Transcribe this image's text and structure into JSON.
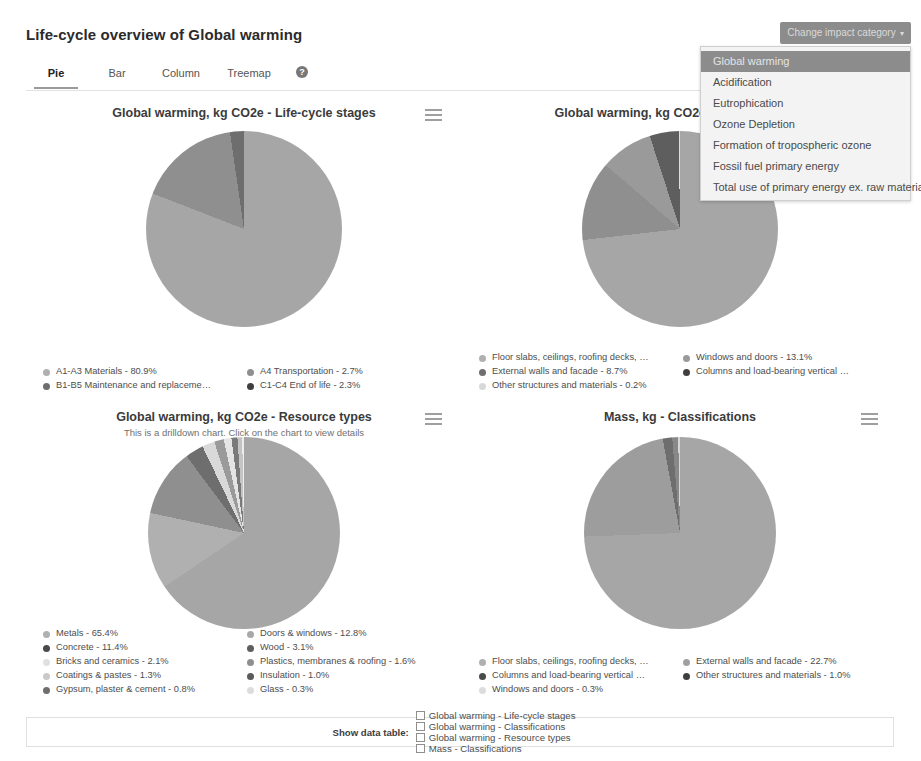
{
  "header": {
    "title": "Life-cycle overview of Global warming",
    "impact_button": "Change impact category",
    "impact_caret": "▾"
  },
  "impact_menu": {
    "items": [
      {
        "label": "Global warming",
        "selected": true
      },
      {
        "label": "Acidification",
        "selected": false
      },
      {
        "label": "Eutrophication",
        "selected": false
      },
      {
        "label": "Ozone Depletion",
        "selected": false
      },
      {
        "label": "Formation of tropospheric ozone",
        "selected": false
      },
      {
        "label": "Fossil fuel primary energy",
        "selected": false
      },
      {
        "label": "Total use of primary energy ex. raw materials",
        "selected": false
      }
    ]
  },
  "tabs": {
    "items": [
      {
        "label": "Pie",
        "active": true
      },
      {
        "label": "Bar",
        "active": false
      },
      {
        "label": "Column",
        "active": false
      },
      {
        "label": "Treemap",
        "active": false
      }
    ],
    "help_glyph": "?"
  },
  "colors": {
    "slice_1": "#a6a6a6",
    "slice_2": "#8f8f8f",
    "slice_3": "#b9b9b9",
    "slice_4": "#6e6e6e",
    "slice_5": "#d9d9d9",
    "slice_6": "#979797",
    "slice_7": "#707070",
    "slice_8": "#c9c9c9",
    "slice_9": "#bdbdbd",
    "slice_10": "#e4e4e4",
    "accent": "#8c8c8c",
    "panel_border": "#e0e0e0"
  },
  "chart_data": [
    {
      "type": "pie",
      "title": "Global warming, kg CO2e - Life-cycle stages",
      "subtitle": "",
      "legend_position": "bottom",
      "categories": [
        "A1-A3 Materials",
        "A4 Transportation",
        "B1-B5 Maintenance and replaceme…",
        "C1-C4 End of life"
      ],
      "legend_labels": [
        "A1-A3 Materials - 80.9%",
        "A4 Transportation - 2.7%",
        "B1-B5 Maintenance and replaceme…",
        "C1-C4 End of life - 2.3%"
      ],
      "values": [
        80.9,
        2.7,
        14.1,
        2.3
      ],
      "unit": "%",
      "slice_colors": [
        "#a6a6a6",
        "#8f8f8f",
        "#8f8f8f",
        "#6e6e6e"
      ],
      "legend_dot_colors": [
        "#b0b0b0",
        "#8f8f8f",
        "#6e6e6e",
        "#3f3f3f"
      ]
    },
    {
      "type": "pie",
      "title": "Global warming, kg CO2e - Classifications",
      "subtitle": "",
      "legend_position": "bottom",
      "categories": [
        "Floor slabs, ceilings, roofing decks, …",
        "Windows and doors",
        "External walls and facade",
        "Columns and load-bearing vertical …",
        "Other structures and materials"
      ],
      "legend_labels": [
        "Floor slabs, ceilings, roofing decks, …",
        "Windows and doors - 13.1%",
        "External walls and facade - 8.7%",
        "Columns and load-bearing vertical …",
        "Other structures and materials - 0.2%"
      ],
      "values": [
        73.2,
        13.1,
        8.7,
        4.8,
        0.2
      ],
      "unit": "%",
      "slice_colors": [
        "#a6a6a6",
        "#8f8f8f",
        "#9a9a9a",
        "#5e5e5e",
        "#e0e0e0"
      ],
      "legend_dot_colors": [
        "#b0b0b0",
        "#9a9a9a",
        "#6e6e6e",
        "#3f3f3f",
        "#d8d8d8"
      ]
    },
    {
      "type": "pie",
      "title": "Global warming, kg CO2e - Resource types",
      "subtitle": "This is a drilldown chart. Click on the chart to view details",
      "legend_position": "bottom",
      "categories": [
        "Metals",
        "Doors & windows",
        "Concrete",
        "Wood",
        "Bricks and ceramics",
        "Plastics, membranes & roofing",
        "Coatings & pastes",
        "Insulation",
        "Gypsum, plaster & cement",
        "Glass"
      ],
      "legend_labels": [
        "Metals - 65.4%",
        "Doors & windows - 12.8%",
        "Concrete - 11.4%",
        "Wood - 3.1%",
        "Bricks and ceramics - 2.1%",
        "Plastics, membranes & roofing - 1.6%",
        "Coatings & pastes - 1.3%",
        "Insulation - 1.0%",
        "Gypsum, plaster & cement - 0.8%",
        "Glass - 0.3%"
      ],
      "values": [
        65.4,
        12.8,
        11.4,
        3.1,
        2.1,
        1.6,
        1.3,
        1.0,
        0.8,
        0.3
      ],
      "unit": "%",
      "slice_colors": [
        "#a6a6a6",
        "#b0b0b0",
        "#8f8f8f",
        "#6e6e6e",
        "#d9d9d9",
        "#9a9a9a",
        "#e4e4e4",
        "#7a7a7a",
        "#c4c4c4",
        "#ededed"
      ],
      "legend_dot_colors": [
        "#b0b0b0",
        "#a8a8a8",
        "#4a4a4a",
        "#5e5e5e",
        "#e0e0e0",
        "#8f8f8f",
        "#c9c9c9",
        "#5a5a5a",
        "#6e6e6e",
        "#dcdcdc"
      ]
    },
    {
      "type": "pie",
      "title": "Mass, kg - Classifications",
      "subtitle": "",
      "legend_position": "bottom",
      "categories": [
        "Floor slabs, ceilings, roofing decks, …",
        "External walls and facade",
        "Columns and load-bearing vertical …",
        "Other structures and materials",
        "Windows and doors"
      ],
      "legend_labels": [
        "Floor slabs, ceilings, roofing decks, …",
        "External walls and facade - 22.7%",
        "Columns and load-bearing vertical …",
        "Other structures and materials - 1.0%",
        "Windows and doors - 0.3%"
      ],
      "values": [
        74.4,
        22.7,
        1.6,
        1.0,
        0.3
      ],
      "unit": "%",
      "slice_colors": [
        "#a6a6a6",
        "#9d9d9d",
        "#6e6e6e",
        "#888888",
        "#d6d6d6"
      ],
      "legend_dot_colors": [
        "#b0b0b0",
        "#a0a0a0",
        "#4a4a4a",
        "#3f3f3f",
        "#dcdcdc"
      ]
    }
  ],
  "data_table_bar": {
    "label": "Show data table:",
    "options": [
      {
        "label": "Global warming - Life-cycle stages",
        "checked": false
      },
      {
        "label": "Global warming - Classifications",
        "checked": false
      },
      {
        "label": "Global warming - Resource types",
        "checked": false
      },
      {
        "label": "Mass - Classifications",
        "checked": false
      }
    ]
  }
}
